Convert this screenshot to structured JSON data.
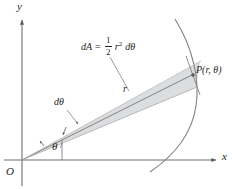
{
  "figure": {
    "name": "polar-area-element-diagram",
    "background_color": "#ffffff",
    "axis_color": "#6d6e71",
    "line_color": "#808285",
    "text_color": "#231f20",
    "wedge_fill": "#dcdddf",
    "curve_color": "#808285"
  },
  "axes": {
    "y_label": "y",
    "x_label": "x",
    "origin_label": "O"
  },
  "labels": {
    "angle": "θ",
    "delta_angle": "dθ",
    "radius": "r",
    "point": "P(r, θ)"
  },
  "formula": {
    "lhs": "dA",
    "equals": "=",
    "fraction_numerator": "1",
    "fraction_denominator": "2",
    "radius_symbol": "r",
    "radius_exponent": "2",
    "differential": "dθ",
    "full_text": "dA = 1/2 r² dθ"
  },
  "geometry": {
    "origin": {
      "x": 22,
      "y": 160
    },
    "point_P": {
      "x": 192,
      "y": 76
    },
    "x_axis_end": {
      "x": 218,
      "y": 160
    },
    "y_axis_top": {
      "x": 22,
      "y": 18
    },
    "theta_degrees": 26
  }
}
